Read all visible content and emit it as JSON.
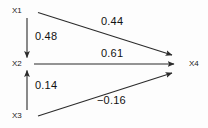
{
  "diagram": {
    "type": "path-diagram",
    "background_color": "#fdfdfd",
    "line_color": "#2b2b2b",
    "text_color": "#111111",
    "nodes": [
      {
        "id": "x1",
        "label": "X1",
        "x": 20,
        "y": 11
      },
      {
        "id": "x2",
        "label": "X2",
        "x": 20,
        "y": 64
      },
      {
        "id": "x3",
        "label": "X3",
        "x": 20,
        "y": 116
      },
      {
        "id": "x4",
        "label": "X4",
        "x": 194,
        "y": 64
      }
    ],
    "edges": [
      {
        "id": "x1-x2",
        "from": "X1",
        "to": "X2",
        "coefficient": "0.48",
        "direction": "down"
      },
      {
        "id": "x1-x4",
        "from": "X1",
        "to": "X4",
        "coefficient": "0.44",
        "direction": "right-down"
      },
      {
        "id": "x2-x4",
        "from": "X2",
        "to": "X4",
        "coefficient": "0.61",
        "direction": "right"
      },
      {
        "id": "x3-x2",
        "from": "X3",
        "to": "X2",
        "coefficient": "0.14",
        "direction": "up"
      },
      {
        "id": "x3-x4",
        "from": "X3",
        "to": "X4",
        "coefficient": "−0.16",
        "direction": "right-up"
      }
    ]
  }
}
